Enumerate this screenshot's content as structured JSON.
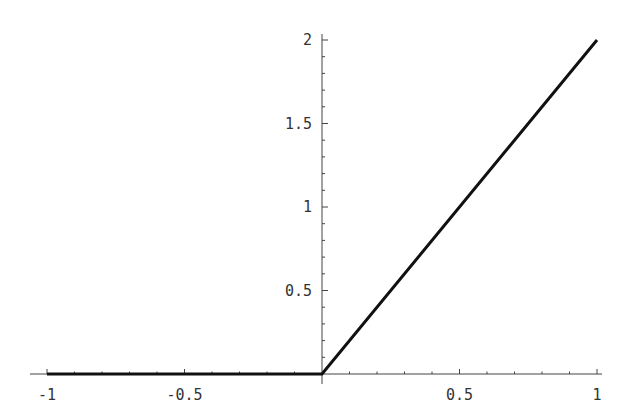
{
  "chart_data": {
    "type": "line",
    "title": "",
    "xlabel": "",
    "ylabel": "",
    "xlim": [
      -1,
      1
    ],
    "ylim": [
      0,
      2
    ],
    "grid": false,
    "legend": null,
    "x_ticks": [
      -1,
      -0.5,
      0.5,
      1
    ],
    "x_tick_labels": [
      "-1",
      "-0.5",
      "0.5",
      "1"
    ],
    "y_ticks": [
      0.5,
      1,
      1.5,
      2
    ],
    "y_tick_labels": [
      "0.5",
      "1",
      "1.5",
      "2"
    ],
    "series": [
      {
        "name": "f(x) = max(0, 2x)",
        "x": [
          -1,
          0,
          1
        ],
        "y": [
          0,
          0,
          2
        ],
        "color": "#111111"
      }
    ]
  },
  "style": {
    "axis_color": "#444444",
    "line_color": "#111111",
    "background": "#ffffff"
  }
}
